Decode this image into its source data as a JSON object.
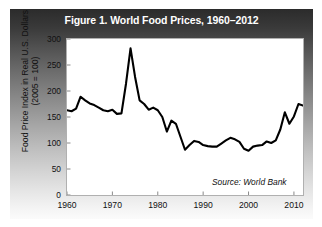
{
  "figure": {
    "title": "Figure 1. World Food Prices, 1960–2012",
    "source_note": "Source: World Bank",
    "title_color": "#ffffff",
    "panel_gradient_top": "#2b2b2b",
    "panel_gradient_bottom": "#fbfbfb",
    "plot_background": "#ffffff",
    "line_color": "#000000"
  },
  "axes": {
    "y_title_main": "Food Price Index in Real U.S. Dollars",
    "y_title_sub": "(2005 = 100)",
    "y_ticks": [
      0,
      50,
      100,
      150,
      200,
      250,
      300
    ],
    "x_ticks": [
      1960,
      1970,
      1980,
      1990,
      2000,
      2010
    ]
  },
  "chart_data": {
    "type": "line",
    "title": "Figure 1. World Food Prices, 1960–2012",
    "xlabel": "",
    "ylabel": "Food Price Index in Real U.S. Dollars (2005 = 100)",
    "xlim": [
      1960,
      2012
    ],
    "ylim": [
      0,
      300
    ],
    "grid": false,
    "legend": "none",
    "annotations": [
      "Source: World Bank"
    ],
    "x": [
      1960,
      1961,
      1962,
      1963,
      1964,
      1965,
      1966,
      1967,
      1968,
      1969,
      1970,
      1971,
      1972,
      1973,
      1974,
      1975,
      1976,
      1977,
      1978,
      1979,
      1980,
      1981,
      1982,
      1983,
      1984,
      1985,
      1986,
      1987,
      1988,
      1989,
      1990,
      1991,
      1992,
      1993,
      1994,
      1995,
      1996,
      1997,
      1998,
      1999,
      2000,
      2001,
      2002,
      2003,
      2004,
      2005,
      2006,
      2007,
      2008,
      2009,
      2010,
      2011,
      2012
    ],
    "y": [
      163,
      161,
      166,
      189,
      182,
      176,
      173,
      168,
      163,
      161,
      164,
      156,
      157,
      214,
      282,
      227,
      182,
      175,
      164,
      168,
      163,
      150,
      122,
      143,
      137,
      112,
      87,
      96,
      104,
      102,
      96,
      94,
      93,
      93,
      99,
      105,
      110,
      107,
      102,
      89,
      85,
      93,
      95,
      96,
      103,
      100,
      105,
      126,
      159,
      137,
      151,
      175,
      172
    ],
    "series": [
      {
        "name": "World food price index (real US$, 2005 = 100)",
        "values": [
          163,
          161,
          166,
          189,
          182,
          176,
          173,
          168,
          163,
          161,
          164,
          156,
          157,
          214,
          282,
          227,
          182,
          175,
          164,
          168,
          163,
          150,
          122,
          143,
          137,
          112,
          87,
          96,
          104,
          102,
          96,
          94,
          93,
          93,
          99,
          105,
          110,
          107,
          102,
          89,
          85,
          93,
          95,
          96,
          103,
          100,
          105,
          126,
          159,
          137,
          151,
          175,
          172
        ]
      }
    ]
  }
}
